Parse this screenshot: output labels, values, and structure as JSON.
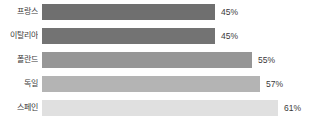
{
  "chart_data": {
    "type": "bar",
    "orientation": "horizontal",
    "title": "",
    "subtitle": "",
    "xlabel": "",
    "ylabel": "",
    "grid": false,
    "legend": false,
    "axis_visible": false,
    "xlim": [
      0,
      61
    ],
    "categories": [
      "프랑스",
      "이탈리아",
      "폴란드",
      "독일",
      "스페인"
    ],
    "values": [
      45,
      45,
      55,
      57,
      61
    ],
    "value_labels": [
      "45%",
      "45%",
      "55%",
      "57%",
      "61%"
    ],
    "bar_colors": [
      "#6f6f6f",
      "#737373",
      "#969696",
      "#b4b4b4",
      "#e0e0e0"
    ],
    "bars": [
      {
        "category": "프랑스",
        "value": 45,
        "label": "45%",
        "color": "#6f6f6f",
        "width_px": 173
      },
      {
        "category": "이탈리아",
        "value": 45,
        "label": "45%",
        "color": "#737373",
        "width_px": 173
      },
      {
        "category": "폴란드",
        "value": 55,
        "label": "55%",
        "color": "#969696",
        "width_px": 210
      },
      {
        "category": "독일",
        "value": 57,
        "label": "57%",
        "color": "#b4b4b4",
        "width_px": 218
      },
      {
        "category": "스페인",
        "value": 61,
        "label": "61%",
        "color": "#e0e0e0",
        "width_px": 236
      }
    ]
  },
  "colors": {
    "background": "#ffffff",
    "text": "#3a3a3a"
  }
}
